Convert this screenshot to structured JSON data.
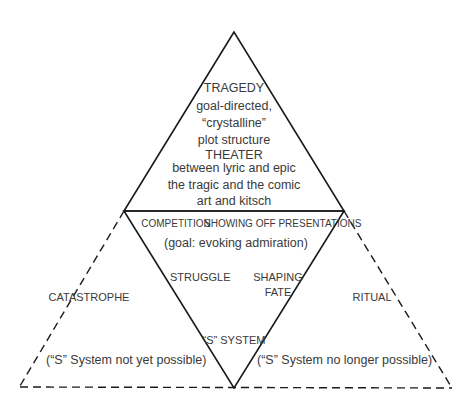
{
  "diagram": {
    "top_triangle": {
      "title": "TRAGEDY",
      "lines": [
        "goal-directed,",
        "“crystalline”",
        "plot structure"
      ],
      "subtitle": "THEATER",
      "sub_lines": [
        "between lyric and epic",
        "the tragic and the comic",
        "art and kitsch"
      ]
    },
    "center_triangle": {
      "header_left": "COMPETITION",
      "header_right": "SHOWING OFF PRESENTATIONS",
      "goal": "(goal: evoking admiration)",
      "left_label": "STRUGGLE",
      "right_label_line1": "SHAPING",
      "right_label_line2": "FATE",
      "bottom_label": "“S” SYSTEM"
    },
    "left_triangle": {
      "label": "CATASTROPHE",
      "note": "(“S” System not yet possible)"
    },
    "right_triangle": {
      "label": "RITUAL",
      "note": "(“S” System no longer possible)"
    },
    "colors": {
      "line": "#1a1a1a",
      "text": "#3a3a3a",
      "background": "#ffffff"
    }
  }
}
